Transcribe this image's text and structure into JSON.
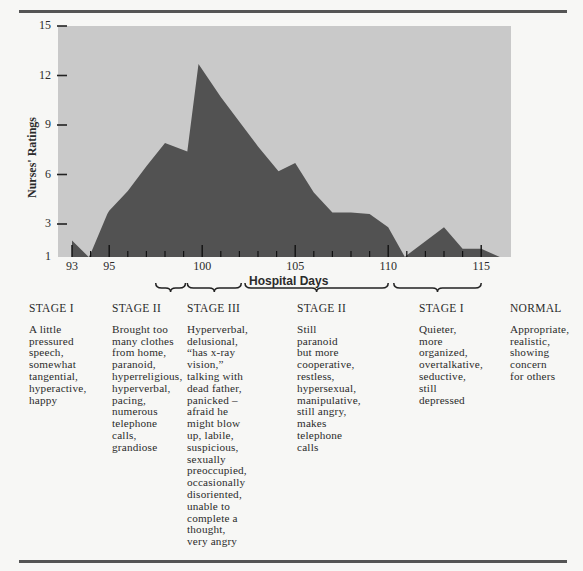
{
  "colors": {
    "plot_background": "#c9c9c9",
    "area_fill": "#525252",
    "rule": "#555555",
    "text": "#2b2b2b"
  },
  "chart_data": {
    "type": "area",
    "title": "",
    "xlabel": "Hospital Days",
    "ylabel": "Nurses' Ratings",
    "xlim": [
      92.2,
      116.5
    ],
    "ylim": [
      1,
      15
    ],
    "grid": false,
    "legend": null,
    "y_ticks": [
      1,
      3,
      6,
      9,
      12,
      15
    ],
    "x_tick_labels": [
      93,
      95,
      100,
      105,
      110,
      115
    ],
    "x_minor_ticks": [
      93,
      94,
      95,
      96,
      97,
      98,
      99,
      100,
      101,
      102,
      103,
      104,
      105,
      106,
      107,
      108,
      109,
      110,
      111,
      112,
      113,
      114,
      115
    ],
    "series": [
      {
        "name": "Nurses' Ratings",
        "x": [
          93,
          93.9,
          94.0,
          94.9,
          95.0,
          96.0,
          97.0,
          98.0,
          99.2,
          99.8,
          101.0,
          102.0,
          103.0,
          104.1,
          105.0,
          106.0,
          107.0,
          108.0,
          109.0,
          110.0,
          110.9,
          111.0,
          113.0,
          114.0,
          115.0,
          116.0
        ],
        "y": [
          2.0,
          1.0,
          1.2,
          3.6,
          3.8,
          5.0,
          6.5,
          7.9,
          7.4,
          12.7,
          10.7,
          9.2,
          7.7,
          6.2,
          6.7,
          4.9,
          3.7,
          3.7,
          3.6,
          2.8,
          1.0,
          1.1,
          2.8,
          1.5,
          1.5,
          1.0
        ]
      }
    ],
    "annotations": [
      {
        "type": "brace",
        "x_start": 97.5,
        "x_end": 99.1,
        "label": "STAGE II"
      },
      {
        "type": "brace",
        "x_start": 99.2,
        "x_end": 102.1,
        "label": "STAGE III"
      },
      {
        "type": "brace",
        "x_start": 102.3,
        "x_end": 110.0,
        "label": "STAGE II"
      },
      {
        "type": "brace",
        "x_start": 110.3,
        "x_end": 115.0,
        "label": "STAGE I"
      }
    ]
  },
  "stages": [
    {
      "title": "STAGE I",
      "description": "A little\npressured\nspeech,\nsomewhat\ntangential,\nhyperactive,\nhappy"
    },
    {
      "title": "STAGE II",
      "description": "Brought too\nmany clothes\nfrom home,\nparanoid,\nhyperreligious,\nhyperverbal,\npacing,\nnumerous\ntelephone\ncalls,\ngrandiose"
    },
    {
      "title": "STAGE III",
      "description": "Hyperverbal,\ndelusional,\n“has x-ray\nvision,”\ntalking with\ndead father,\npanicked –\nafraid he\nmight blow\nup, labile,\nsuspicious,\nsexually\npreoccupied,\noccasionally\ndisoriented,\nunable to\ncomplete a\nthought,\nvery angry"
    },
    {
      "title": "STAGE II",
      "description": "Still\nparanoid\nbut more\ncooperative,\nrestless,\nhypersexual,\nmanipulative,\nstill angry,\nmakes\ntelephone\ncalls"
    },
    {
      "title": "STAGE I",
      "description": "Quieter,\nmore\norganized,\novertalkative,\nseductive,\nstill\ndepressed"
    },
    {
      "title": "NORMAL",
      "description": "Appropriate,\nrealistic,\nshowing\nconcern\nfor others"
    }
  ],
  "axis_text": {
    "y_ticks": [
      "15",
      "12",
      "9",
      "6",
      "3",
      "1"
    ],
    "x_ticks": [
      "93",
      "95",
      "100",
      "105",
      "110",
      "115"
    ],
    "xlabel": "Hospital Days",
    "ylabel": "Nurses' Ratings"
  }
}
